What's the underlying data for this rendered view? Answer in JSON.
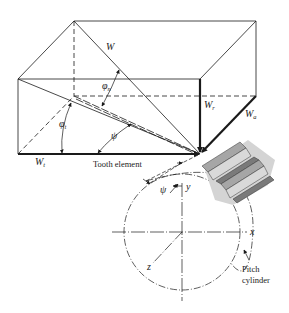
{
  "diagram": {
    "force_labels": {
      "W": "W",
      "Wr_base": "W",
      "Wr_sub": "r",
      "Wa_base": "W",
      "Wa_sub": "a",
      "Wt_base": "W",
      "Wt_sub": "t"
    },
    "angle_labels": {
      "phi_n_base": "φ",
      "phi_n_sub": "n",
      "phi_t_base": "φ",
      "phi_t_sub": "t",
      "psi_box": "ψ",
      "psi_tooth": "ψ"
    },
    "axis_labels": {
      "x": "x",
      "y": "y",
      "z": "z"
    },
    "callouts": {
      "tooth_element": "Tooth element",
      "pitch_cylinder_line1": "Pitch",
      "pitch_cylinder_line2": "cylinder"
    },
    "colors": {
      "line": "#1a1a1a",
      "gear_light": "#d9d9d9",
      "gear_mid": "#a6a6a6",
      "gear_dark": "#7a7a7a",
      "shadow": "#d4d4d4"
    }
  }
}
